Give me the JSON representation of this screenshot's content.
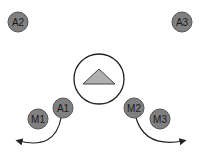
{
  "diagram": {
    "nodes": [
      {
        "id": "A2",
        "label": "A2",
        "cx": 18,
        "cy": 22,
        "r": 10
      },
      {
        "id": "A3",
        "label": "A3",
        "cx": 182,
        "cy": 22,
        "r": 10
      },
      {
        "id": "A1",
        "label": "A1",
        "cx": 63,
        "cy": 108,
        "r": 10
      },
      {
        "id": "M1",
        "label": "M1",
        "cx": 38,
        "cy": 119,
        "r": 10
      },
      {
        "id": "M2",
        "label": "M2",
        "cx": 134,
        "cy": 108,
        "r": 10
      },
      {
        "id": "M3",
        "label": "M3",
        "cx": 160,
        "cy": 119,
        "r": 10
      }
    ],
    "center": {
      "shape": "circle-with-triangle",
      "cx": 99,
      "cy": 79,
      "r": 25
    },
    "colors": {
      "node_fill": "#808080",
      "node_stroke": "#555555",
      "triangle_fill": "#b0b0b0",
      "line": "#222222"
    }
  }
}
